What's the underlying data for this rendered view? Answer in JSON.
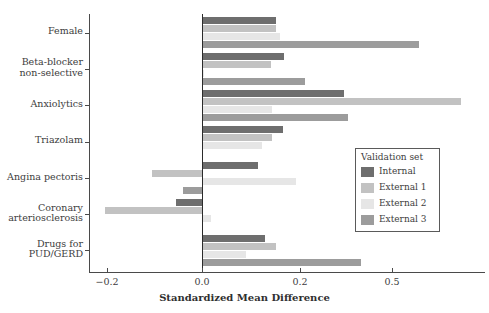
{
  "chart_data": {
    "type": "bar",
    "orientation": "horizontal",
    "title": "",
    "xlabel": "Standardized Mean Difference",
    "ylabel": "",
    "xticks": [
      -0.2,
      0.0,
      0.2,
      0.5
    ],
    "xtick_labels": [
      "−0.2",
      "0.0",
      "0.2",
      "0.5"
    ],
    "xlim": [
      -0.235,
      0.88
    ],
    "grid": false,
    "axis_scale": "symlog-like (non-linear: compressed beyond 0.2)",
    "zero_reference_line": true,
    "categories": [
      "Female",
      "Beta-blocker\nnon-selective",
      "Anxiolytics",
      "Triazolam",
      "Angina pectoris",
      "Coronary\narteriosclerosis",
      "Drugs for\nPUD/GERD"
    ],
    "series": [
      {
        "name": "Internal",
        "color": "#6e6e6e",
        "values": [
          0.152,
          0.168,
          0.345,
          0.165,
          0.115,
          -0.055,
          0.128
        ]
      },
      {
        "name": "External 1",
        "color": "#c2c2c2",
        "values": [
          0.15,
          0.14,
          0.845,
          0.143,
          -0.105,
          -0.205,
          0.152
        ]
      },
      {
        "name": "External 2",
        "color": "#e6e6e6",
        "values": [
          0.16,
          0.005,
          0.143,
          0.122,
          0.192,
          0.018,
          0.09
        ]
      },
      {
        "name": "External 3",
        "color": "#9c9c9c",
        "values": [
          0.635,
          0.215,
          0.355,
          0.0,
          -0.04,
          0.0,
          0.4
        ]
      }
    ],
    "legend": {
      "title": "Validation set",
      "position": "center-right",
      "entries": [
        "Internal",
        "External 1",
        "External 2",
        "External 3"
      ]
    }
  },
  "legend": {
    "title": "Validation set",
    "items": [
      {
        "label": "Internal",
        "color": "#6e6e6e"
      },
      {
        "label": "External 1",
        "color": "#c2c2c2"
      },
      {
        "label": "External 2",
        "color": "#e6e6e6"
      },
      {
        "label": "External 3",
        "color": "#9c9c9c"
      }
    ]
  },
  "axis": {
    "x_title": "Standardized Mean Difference",
    "x_tick_labels": [
      "−0.2",
      "0.0",
      "0.2",
      "0.5"
    ],
    "y_tick_labels": [
      "Female",
      "Beta-blocker\nnon-selective",
      "Anxiolytics",
      "Triazolam",
      "Angina pectoris",
      "Coronary\narteriosclerosis",
      "Drugs for\nPUD/GERD"
    ]
  }
}
